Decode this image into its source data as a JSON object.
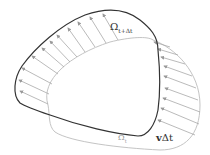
{
  "diagram": {
    "labels": {
      "omega_next": {
        "symbol": "Ω",
        "subscript": "t+Δt"
      },
      "omega_current": {
        "symbol": "Ω",
        "subscript": "t"
      },
      "displacement": {
        "bold": "v",
        "rest": "Δt"
      }
    },
    "colors": {
      "omega_next_stroke": "#333333",
      "omega_current_stroke": "#c4c4c4",
      "arrow_stroke": "#a8a8a8"
    },
    "arrow_count": 20
  }
}
